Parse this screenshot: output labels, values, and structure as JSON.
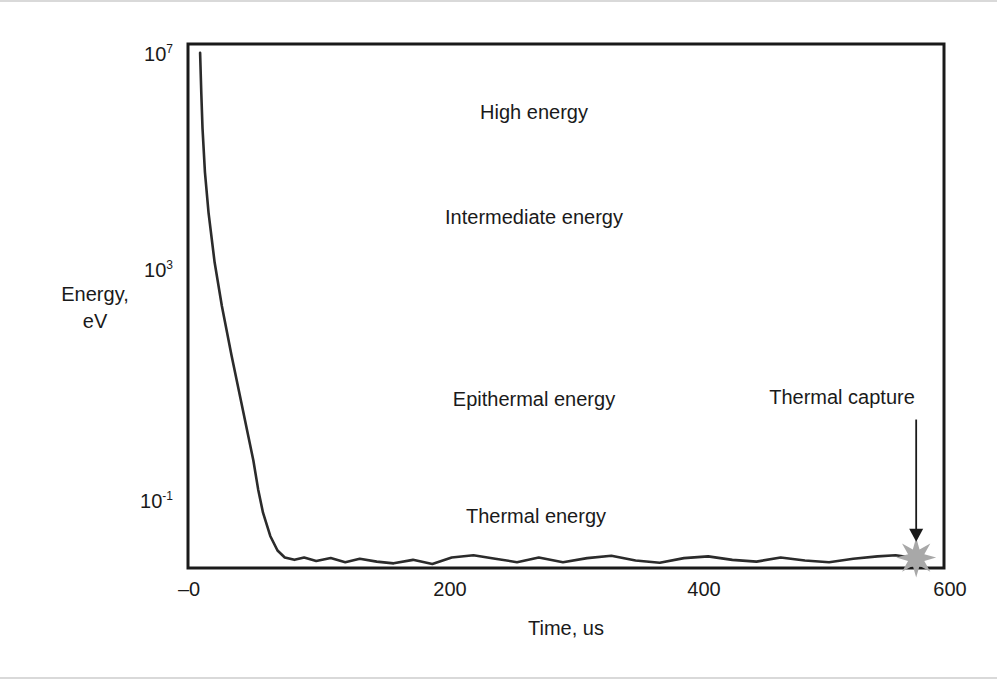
{
  "chart_data": {
    "type": "line",
    "title": "",
    "subtitle": "",
    "xlabel": "Time, us",
    "ylabel": "Energy,\neV",
    "ylabel_lines": [
      "Energy,",
      "eV"
    ],
    "x_tick_labels": [
      "–0",
      "200",
      "400",
      "600"
    ],
    "x_tick_values": [
      0,
      200,
      400,
      600
    ],
    "xlim": [
      -10,
      615
    ],
    "y_tick_labels": [
      "10⁷",
      "10³",
      "10⁻¹"
    ],
    "y_tick_bases": [
      "10",
      "10",
      "10"
    ],
    "y_tick_exponents": [
      "7",
      "3",
      "-1"
    ],
    "y_tick_values": [
      10000000.0,
      1000.0,
      0.1
    ],
    "ylim_log10": [
      -1.8,
      7.2
    ],
    "y_scale": "log",
    "grid": false,
    "legend": null,
    "line_color": "#2b2b2b",
    "line_width": 2.6,
    "frame_color": "#1a1a1a",
    "accent_color": "#a8a8a8",
    "background": "#ffffff",
    "series": [
      {
        "name": "Neutron energy decay",
        "comment": "log10(Energy in eV) versus time in microseconds",
        "x": [
          0,
          1,
          2,
          4,
          7,
          12,
          18,
          26,
          34,
          40,
          44,
          48,
          52,
          58,
          64,
          70,
          78,
          86,
          96,
          108,
          120,
          132,
          146,
          160,
          176,
          192,
          208,
          226,
          244,
          262,
          280,
          300,
          320,
          340,
          360,
          380,
          400,
          420,
          440,
          460,
          480,
          500,
          520,
          540,
          560,
          575,
          588
        ],
        "y_log10": [
          7.05,
          6.35,
          5.75,
          5.0,
          4.3,
          3.45,
          2.7,
          1.85,
          1.05,
          0.45,
          0.05,
          -0.45,
          -0.85,
          -1.25,
          -1.5,
          -1.62,
          -1.66,
          -1.62,
          -1.68,
          -1.63,
          -1.7,
          -1.64,
          -1.69,
          -1.72,
          -1.66,
          -1.73,
          -1.62,
          -1.58,
          -1.64,
          -1.7,
          -1.62,
          -1.7,
          -1.63,
          -1.59,
          -1.67,
          -1.71,
          -1.63,
          -1.6,
          -1.66,
          -1.69,
          -1.62,
          -1.67,
          -1.7,
          -1.64,
          -1.6,
          -1.58,
          -1.62
        ]
      }
    ],
    "annotations": [
      {
        "id": "high",
        "text": "High energy",
        "x": 300,
        "y_log10": 6.1
      },
      {
        "id": "intermediate",
        "text": "Intermediate energy",
        "x": 300,
        "y_log10": 4.2
      },
      {
        "id": "epithermal",
        "text": "Epithermal energy",
        "x": 300,
        "y_log10": 0.9
      },
      {
        "id": "thermal",
        "text": "Thermal energy",
        "x": 300,
        "y_log10": -0.9
      },
      {
        "id": "capture",
        "text": "Thermal capture",
        "x": 560,
        "y_log10": 0.95
      }
    ],
    "markers": [
      {
        "id": "thermal-capture-burst",
        "shape": "starburst",
        "points": 8,
        "color": "#a8a8a8",
        "x": 592,
        "y_log10": -1.62,
        "size_px": 40
      }
    ],
    "arrows": [
      {
        "id": "thermal-capture-arrow",
        "from_x": 592,
        "from_y_log10": 0.75,
        "to_x": 592,
        "to_y_log10": -1.35,
        "color": "#1a1a1a"
      }
    ]
  },
  "figure": {
    "axis_titles": {
      "y_line1": "Energy,",
      "y_line2": "eV",
      "x": "Time, us"
    },
    "y_ticks": [
      {
        "base": "10",
        "exp": "7"
      },
      {
        "base": "10",
        "exp": "3"
      },
      {
        "base": "10",
        "exp": "-1"
      }
    ],
    "x_ticks": [
      "–0",
      "200",
      "400",
      "600"
    ],
    "annotations": {
      "high": "High energy",
      "intermediate": "Intermediate energy",
      "epithermal": "Epithermal energy",
      "thermal": "Thermal energy",
      "capture": "Thermal capture"
    }
  }
}
